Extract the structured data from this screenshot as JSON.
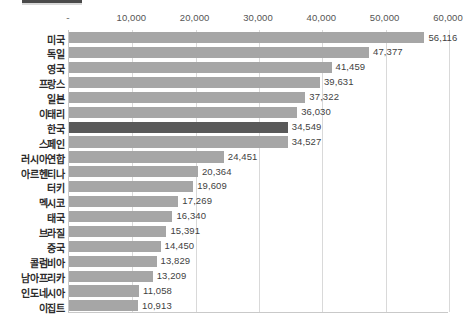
{
  "chart_data": {
    "type": "bar",
    "orientation": "horizontal",
    "title": "",
    "subtitle": "",
    "xlabel": "",
    "ylabel": "",
    "xlim": [
      0,
      60000
    ],
    "grid": true,
    "legend": null,
    "highlight_category": "한국",
    "highlight_color": "#595959",
    "bar_color": "#a6a6a6",
    "gridline_color": "#d9d9d9",
    "axis_color": "#c9c9c9",
    "tick_labels": [
      "-",
      "10,000",
      "20,000",
      "30,000",
      "40,000",
      "50,000",
      "60,000"
    ],
    "tick_values": [
      0,
      10000,
      20000,
      30000,
      40000,
      50000,
      60000
    ],
    "categories": [
      "미국",
      "독일",
      "영국",
      "프랑스",
      "일본",
      "이태리",
      "한국",
      "스페인",
      "러시아연합",
      "아르헨티나",
      "터키",
      "멕시코",
      "태국",
      "브라질",
      "중국",
      "콜럼비아",
      "남아프리카",
      "인도네시아",
      "이집트"
    ],
    "values": [
      56116,
      47377,
      41459,
      39631,
      37322,
      36030,
      34549,
      34527,
      24451,
      20364,
      19609,
      17269,
      16340,
      15391,
      14450,
      13829,
      13209,
      11058,
      10913
    ],
    "value_labels": [
      "56,116",
      "47,377",
      "41,459",
      "39,631",
      "37,322",
      "36,030",
      "34,549",
      "34,527",
      "24,451",
      "20,364",
      "19,609",
      "17,269",
      "16,340",
      "15,391",
      "14,450",
      "13,829",
      "13,209",
      "11,058",
      "10,913"
    ]
  }
}
